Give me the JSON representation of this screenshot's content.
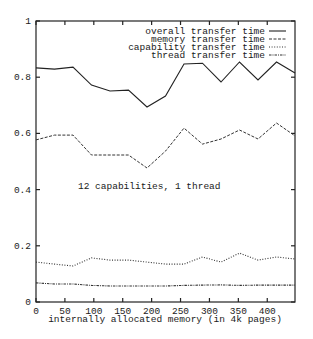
{
  "chart_data": {
    "type": "line",
    "title": "",
    "annotation": "12 capabilities, 1 thread",
    "xlabel": "internally allocated memory (in 4k pages)",
    "ylabel": "",
    "xlim": [
      0,
      448
    ],
    "ylim": [
      0,
      1
    ],
    "xticks": [
      0,
      50,
      100,
      150,
      200,
      250,
      300,
      350,
      400
    ],
    "xtick_labels": [
      "0",
      "50",
      "100",
      "150",
      "200",
      "250",
      "300",
      "350",
      "400"
    ],
    "yticks": [
      0,
      0.2,
      0.4,
      0.6,
      0.8,
      1
    ],
    "ytick_labels": [
      "0",
      "0.2",
      "0.4",
      "0.6",
      "0.8",
      "1"
    ],
    "grid": false,
    "legend_position": "top-right",
    "x": [
      0,
      32,
      64,
      96,
      128,
      160,
      192,
      224,
      256,
      288,
      320,
      352,
      384,
      416,
      448
    ],
    "series": [
      {
        "name": "overall transfer time",
        "style": "solid",
        "values": [
          0.833,
          0.829,
          0.836,
          0.772,
          0.751,
          0.754,
          0.694,
          0.733,
          0.847,
          0.85,
          0.783,
          0.854,
          0.79,
          0.854,
          0.815
        ]
      },
      {
        "name": "memory transfer time",
        "style": "dashed",
        "values": [
          0.577,
          0.594,
          0.594,
          0.523,
          0.523,
          0.523,
          0.477,
          0.537,
          0.619,
          0.562,
          0.58,
          0.612,
          0.58,
          0.637,
          0.591
        ]
      },
      {
        "name": "capability transfer time",
        "style": "dotted",
        "values": [
          0.142,
          0.135,
          0.128,
          0.157,
          0.149,
          0.149,
          0.142,
          0.135,
          0.135,
          0.16,
          0.142,
          0.174,
          0.149,
          0.16,
          0.153
        ]
      },
      {
        "name": "thread transfer time",
        "style": "dash-dot",
        "values": [
          0.068,
          0.064,
          0.064,
          0.059,
          0.057,
          0.057,
          0.057,
          0.057,
          0.059,
          0.06,
          0.061,
          0.059,
          0.06,
          0.06,
          0.06
        ]
      }
    ]
  }
}
